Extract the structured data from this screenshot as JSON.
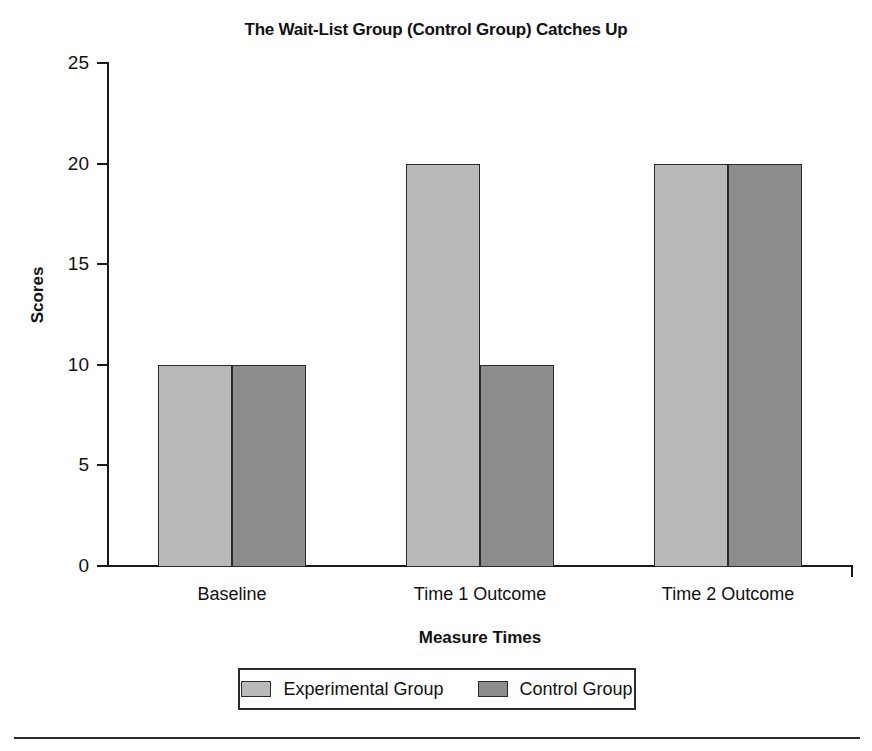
{
  "chart_data": {
    "type": "bar",
    "title": "The Wait-List Group (Control Group) Catches Up",
    "xlabel": "Measure Times",
    "ylabel": "Scores",
    "categories": [
      "Baseline",
      "Time 1 Outcome",
      "Time 2 Outcome"
    ],
    "series": [
      {
        "name": "Experimental Group",
        "values": [
          10,
          20,
          20
        ],
        "color": "#b9b9b9"
      },
      {
        "name": "Control Group",
        "values": [
          10,
          10,
          20
        ],
        "color": "#8c8c8c"
      }
    ],
    "ylim": [
      0,
      25
    ],
    "yticks": [
      0,
      5,
      10,
      15,
      20,
      25
    ],
    "ytick_labels": [
      "0",
      "5",
      "10",
      "15",
      "20",
      "25"
    ],
    "grid": false,
    "legend_position": "bottom"
  },
  "legend": {
    "entries": [
      {
        "label": "Experimental Group",
        "swatch": "experimental-swatch"
      },
      {
        "label": "Control Group",
        "swatch": "control-swatch"
      }
    ]
  }
}
